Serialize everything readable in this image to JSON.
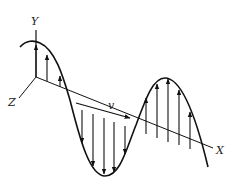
{
  "diagram": {
    "labels": {
      "y_axis": "Y",
      "x_axis": "X",
      "z_axis": "Z",
      "velocity": "v"
    },
    "colors": {
      "stroke": "#111111",
      "background": "#ffffff"
    }
  }
}
